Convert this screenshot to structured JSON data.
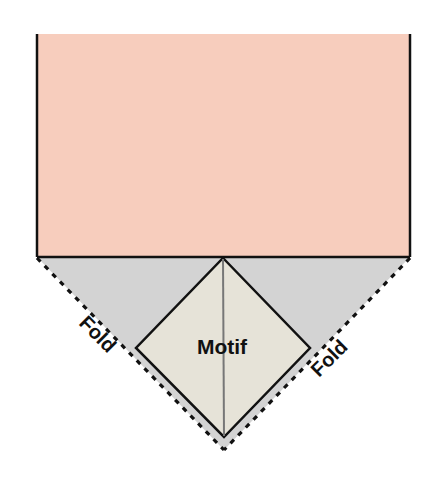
{
  "diagram": {
    "labels": {
      "motif": "Motif",
      "fold_left": "Fold",
      "fold_right": "Fold"
    },
    "colors": {
      "fabric": "#f7cdbd",
      "fold_flap": "#d3d3d3",
      "motif": "#e6e3d8",
      "outline": "#111111",
      "center_line": "#777777",
      "background": "#ffffff"
    }
  }
}
